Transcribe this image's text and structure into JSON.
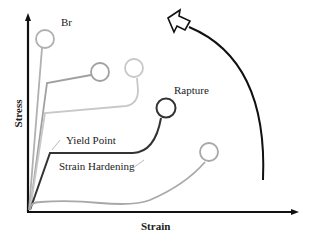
{
  "diagram": {
    "type": "stress-strain curves",
    "axes": {
      "x_label": "Strain",
      "y_label": "Stress"
    },
    "annotations": {
      "br": "Br",
      "rapture": "Rapture",
      "yield_point": "Yield Point",
      "strain_hardening": "Strain Hardening"
    },
    "curves": [
      {
        "name": "brittle",
        "end_marker": "circle",
        "color": "#b0b0b0"
      },
      {
        "name": "curve-2",
        "end_marker": "circle",
        "color": "#a0a0a0"
      },
      {
        "name": "curve-3",
        "end_marker": "circle",
        "color": "#c8c8c8"
      },
      {
        "name": "ductile-rapture",
        "end_marker": "circle",
        "color": "#333333"
      },
      {
        "name": "curve-5",
        "end_marker": "circle",
        "color": "#a8a8a8"
      }
    ],
    "trend_arrow": {
      "direction": "up-left",
      "color": "#111111"
    }
  }
}
